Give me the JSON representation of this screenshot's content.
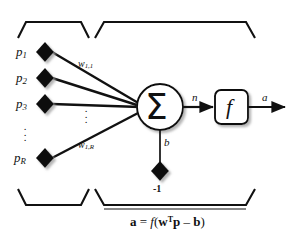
{
  "diagram": {
    "sections": {
      "input_bracket_label": "Input",
      "neuron_bracket_label": "General Neuron"
    },
    "inputs": [
      {
        "name": "p1",
        "label": "p",
        "subscript": "1"
      },
      {
        "name": "p2",
        "label": "p",
        "subscript": "2"
      },
      {
        "name": "p3",
        "label": "p",
        "subscript": "3"
      },
      {
        "name": "pR",
        "label": "p",
        "subscript": "R"
      }
    ],
    "input_ellipsis": "⋮",
    "weights": [
      {
        "name": "w11",
        "label": "w",
        "subscript": "1,1"
      },
      {
        "name": "w1R",
        "label": "w",
        "subscript": "1,R"
      }
    ],
    "weight_ellipsis": "⋮",
    "summation_symbol": "Σ",
    "net_input_label": "n",
    "transfer_function_symbol": "f",
    "output_label": "a",
    "bias_label": "b",
    "bias_input_value": "-1",
    "equation": {
      "output": "a",
      "equals": "=",
      "function": "f",
      "open_paren": "(",
      "weight_vector": "w",
      "transpose": "T",
      "input_vector": "p",
      "minus": "–",
      "bias": "b",
      "close_paren": ")",
      "full_text": "a = f(wTp – b)"
    },
    "colors": {
      "stroke": "#111111",
      "background": "#ffffff",
      "node_fill": "#111111",
      "shadow": "#b8b8b8"
    }
  }
}
